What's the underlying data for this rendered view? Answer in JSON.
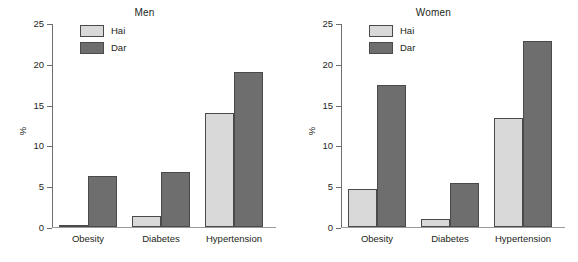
{
  "chart_data": [
    {
      "type": "bar",
      "title": "Men",
      "xlabel": "",
      "ylabel": "%",
      "categories": [
        "Obesity",
        "Diabetes",
        "Hypertension"
      ],
      "series": [
        {
          "name": "Hai",
          "values": [
            0.3,
            1.3,
            14.0
          ],
          "color": "#d9d9d9"
        },
        {
          "name": "Dar",
          "values": [
            6.3,
            6.7,
            19.0
          ],
          "color": "#6e6e6e"
        }
      ],
      "ylim": [
        0,
        25
      ],
      "yticks": [
        0,
        5,
        10,
        15,
        20,
        25
      ],
      "ytick_labels": [
        "0",
        "5",
        "10",
        "15",
        "20",
        "25"
      ],
      "grid": false,
      "legend_position": "top-left"
    },
    {
      "type": "bar",
      "title": "Women",
      "xlabel": "",
      "ylabel": "%",
      "categories": [
        "Obesity",
        "Diabetes",
        "Hypertension"
      ],
      "series": [
        {
          "name": "Hai",
          "values": [
            4.7,
            1.0,
            13.3
          ],
          "color": "#d9d9d9"
        },
        {
          "name": "Dar",
          "values": [
            17.4,
            5.4,
            22.8
          ],
          "color": "#6e6e6e"
        }
      ],
      "ylim": [
        0,
        25
      ],
      "yticks": [
        0,
        5,
        10,
        15,
        20,
        25
      ],
      "ytick_labels": [
        "0",
        "5",
        "10",
        "15",
        "20",
        "25"
      ],
      "grid": false,
      "legend_position": "top-left"
    }
  ]
}
